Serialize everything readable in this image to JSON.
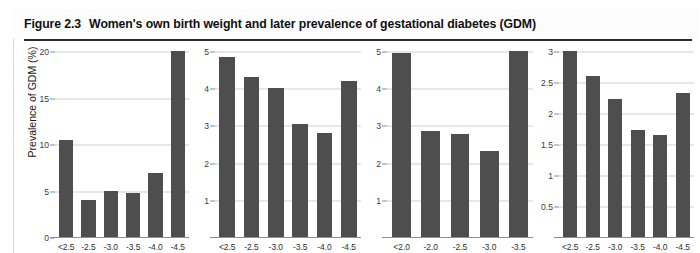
{
  "figure": {
    "number": "Figure 2.3",
    "title": "Women's own birth weight and later prevalence of gestational diabetes (GDM)",
    "y_axis_label": "Prevalence of GDM (%)",
    "bar_color": "#4e4e4e",
    "gridline_color": "#cfcfcf",
    "axis_color": "#8f8f8f"
  },
  "chart_data": [
    {
      "type": "bar",
      "panel_index": 0,
      "title": "",
      "xlabel": "",
      "ylabel": "Prevalence of GDM (%)",
      "categories": [
        "<2.5",
        "-2.5",
        "-3.0",
        "-3.5",
        "-4.0",
        "-4.5"
      ],
      "values": [
        10.4,
        4.0,
        5.0,
        4.7,
        6.9,
        20.0
      ],
      "yticks": [
        0,
        5,
        10,
        15,
        20
      ],
      "yticklabels": [
        "0",
        "5",
        "10",
        "15",
        "20"
      ],
      "ylim": [
        0,
        20
      ],
      "grid": true,
      "legend": "none"
    },
    {
      "type": "bar",
      "panel_index": 1,
      "title": "",
      "xlabel": "",
      "ylabel": "",
      "categories": [
        "<2.5",
        "-2.5",
        "-3.0",
        "-3.5",
        "-4.0",
        "-4.5"
      ],
      "values": [
        4.85,
        4.3,
        4.0,
        3.05,
        2.8,
        4.2
      ],
      "yticks": [
        1,
        2,
        3,
        4,
        5
      ],
      "yticklabels": [
        "1",
        "2",
        "3",
        "4",
        "5"
      ],
      "ylim": [
        0,
        5
      ],
      "grid": true,
      "legend": "none"
    },
    {
      "type": "bar",
      "panel_index": 2,
      "title": "",
      "xlabel": "",
      "ylabel": "",
      "categories": [
        "<2.0",
        "-2.0",
        "-2.5",
        "-3.0",
        "-3.5"
      ],
      "values": [
        4.95,
        2.85,
        2.78,
        2.3,
        5.0
      ],
      "yticks": [
        1,
        2,
        3,
        4,
        5
      ],
      "yticklabels": [
        "1",
        "2",
        "3",
        "4",
        "5"
      ],
      "ylim": [
        0,
        5
      ],
      "grid": true,
      "legend": "none"
    },
    {
      "type": "bar",
      "panel_index": 3,
      "title": "",
      "xlabel": "",
      "ylabel": "",
      "categories": [
        "<2.5",
        "-2.5",
        "-3.0",
        "-3.5",
        "-4.0",
        "-4.5"
      ],
      "values": [
        3.0,
        2.6,
        2.22,
        1.72,
        1.64,
        2.33
      ],
      "yticks": [
        0.5,
        1,
        1.5,
        2,
        2.5,
        3
      ],
      "yticklabels": [
        "0.5",
        "1",
        "1.5",
        "2",
        "2.5",
        "3"
      ],
      "ylim": [
        0,
        3
      ],
      "grid": true,
      "legend": "none"
    }
  ]
}
